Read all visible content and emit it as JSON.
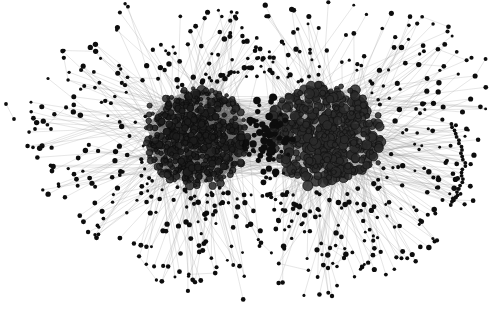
{
  "figure": {
    "kind": "network-graph",
    "title": "",
    "caption": "",
    "width": 490,
    "height": 333,
    "background_color": "#ffffff"
  },
  "chart_data": {
    "type": "scatter",
    "title": "",
    "xlabel": "",
    "ylabel": "",
    "grid": false,
    "legend": "none",
    "xlim": [
      0,
      490
    ],
    "ylim": [
      0,
      333
    ],
    "graph_layout": "force-directed",
    "node_style": {
      "shape": "circle",
      "fill_color": "#0d0d0d",
      "stroke_color": "#000000",
      "core_fill_color": "#2a2a2a",
      "core_ring_color": "#111111",
      "peripheral_radius_px": 1.9,
      "core_radius_px": 2.6,
      "hub_radius_px": 4.4
    },
    "edge_style": {
      "color": "#9a9a9a",
      "core_color": "#777777",
      "width_px": 0.45,
      "opacity": 0.55,
      "curved": false
    },
    "clusters": [
      {
        "id": "left-community",
        "label": "",
        "center_x": 197,
        "center_y": 137,
        "radius_x": 52,
        "radius_y": 50,
        "node_count": 520,
        "density": "very-high",
        "mean_node_radius_px": 2.3,
        "fill_appearance": "#1a1a1a"
      },
      {
        "id": "right-community",
        "label": "",
        "center_x": 327,
        "center_y": 134,
        "radius_x": 57,
        "radius_y": 50,
        "node_count": 470,
        "density": "high",
        "mean_node_radius_px": 3.1,
        "fill_appearance": "#3a3a3a"
      }
    ],
    "bridge": {
      "id": "inter-community-bridge",
      "center_x": 268,
      "center_y": 140,
      "radius_x": 26,
      "radius_y": 44,
      "edge_count": 220,
      "appearance": "light-gray-overlap-region"
    },
    "halo": {
      "id": "peripheral-leaf-halo",
      "node_count": 640,
      "inner_radius": 62,
      "outer_radius": 175,
      "edge_type": "single-spoke-to-core"
    },
    "isolates": [
      {
        "id": "isolate-pair-1",
        "x1": 6,
        "y1": 104,
        "x2": 14,
        "y2": 119
      },
      {
        "id": "isolate-pair-2",
        "x1": 35,
        "y1": 129,
        "x2": 51,
        "y2": 129
      }
    ],
    "fan_groups": [
      {
        "id": "right-arc-fan",
        "anchor_x": 455,
        "anchor_y": 124,
        "node_count": 26,
        "span_y": [
          124,
          205
        ],
        "description": "Arc-shaped chain of leaf nodes along the right margin"
      },
      {
        "id": "bottom-right-triangle",
        "anchor_x": 330,
        "anchor_y": 262,
        "node_count": 4,
        "description": "Small triangular motif below the right community"
      }
    ],
    "totals": {
      "nodes": 1630,
      "edges": 2950,
      "components": 3
    },
    "stats_labels": {
      "nodes": "nodes",
      "edges": "edges",
      "communities": "communities"
    }
  }
}
